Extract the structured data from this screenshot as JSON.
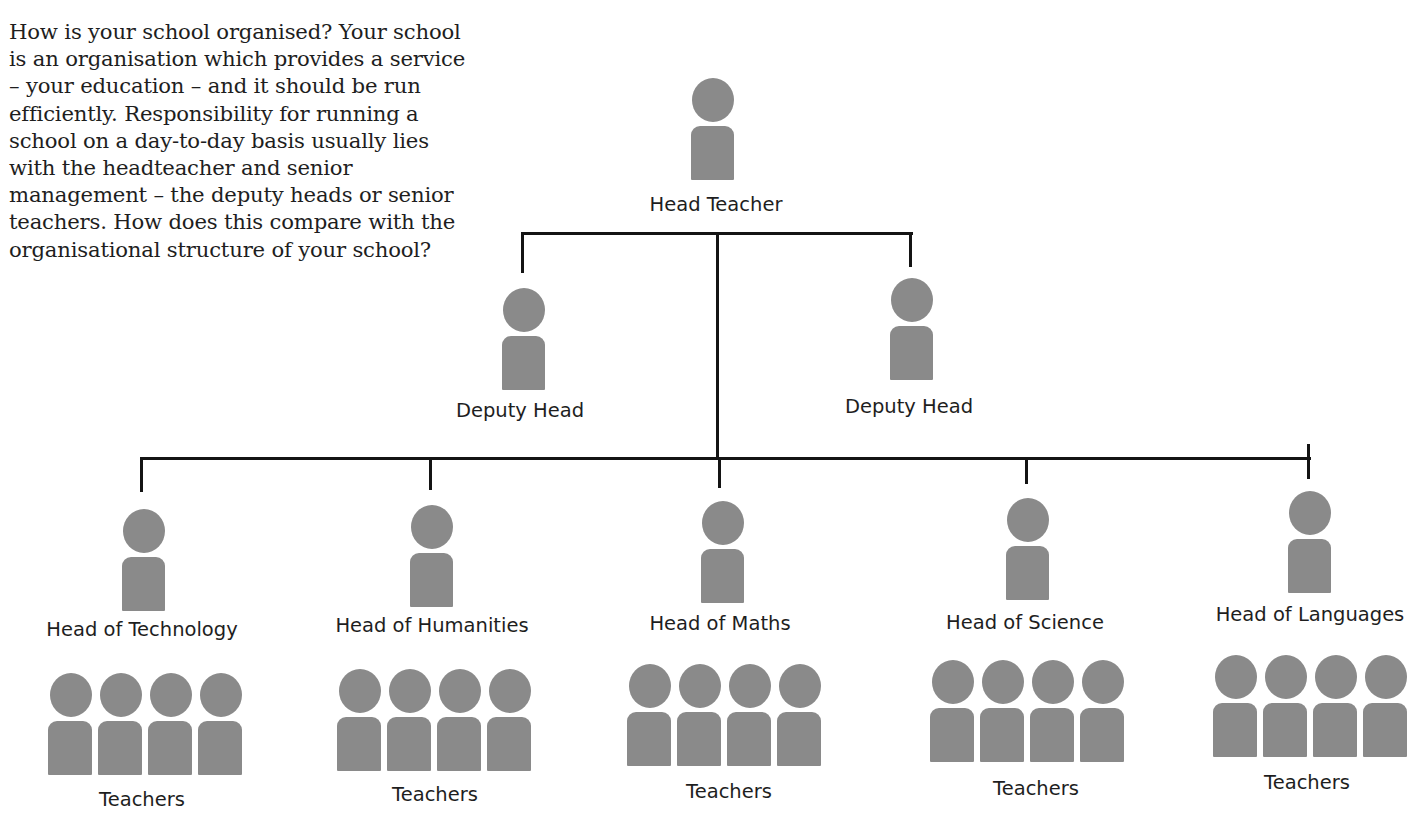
{
  "intro_text": "How is your school organised? Your school is an organisation which provides a service – your education – and it should be run efficiently. Responsibility for running a school on a day-to-day basis usually lies with the headteacher and senior management – the deputy heads or senior teachers. How does this compare with the organisational structure of your school?",
  "colors": {
    "figure": "#8a8a8a",
    "line": "#141414",
    "text": "#1e1e1e"
  },
  "chart": {
    "head": {
      "label": "Head Teacher"
    },
    "deputies": [
      {
        "label": "Deputy Head"
      },
      {
        "label": "Deputy Head"
      }
    ],
    "departments": [
      {
        "label": "Head of Technology",
        "team_label": "Teachers",
        "team_size": 4
      },
      {
        "label": "Head of Humanities",
        "team_label": "Teachers",
        "team_size": 4
      },
      {
        "label": "Head of Maths",
        "team_label": "Teachers",
        "team_size": 4
      },
      {
        "label": "Head of Science",
        "team_label": "Teachers",
        "team_size": 4
      },
      {
        "label": "Head of Languages",
        "team_label": "Teachers",
        "team_size": 4
      }
    ]
  }
}
